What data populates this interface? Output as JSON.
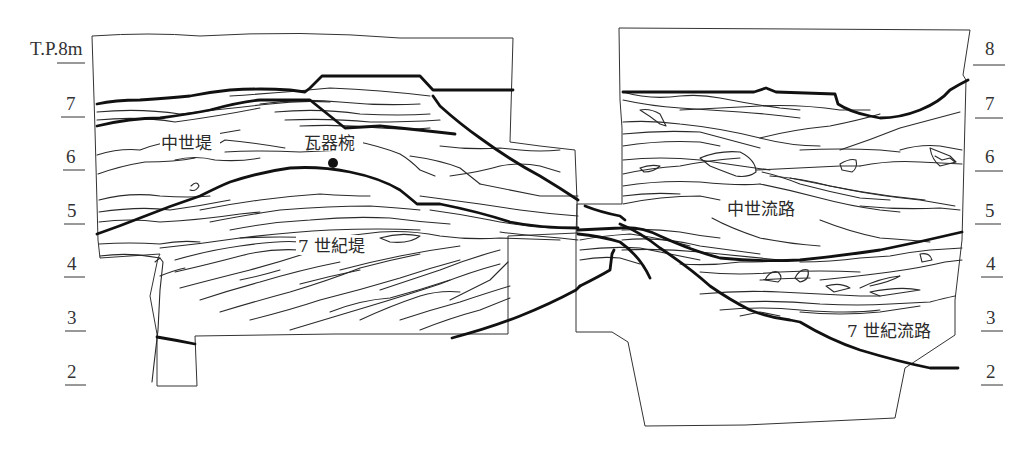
{
  "diagram": {
    "type": "stratigraphic cross-section",
    "ink_color": "#222222",
    "background": "#ffffff"
  },
  "left_scale": {
    "unit_label": "T.P.8m",
    "ticks": [
      {
        "label": "T.P.8m",
        "y": 62
      },
      {
        "label": "7",
        "y": 117
      },
      {
        "label": "6",
        "y": 170
      },
      {
        "label": "5",
        "y": 224
      },
      {
        "label": "4",
        "y": 277
      },
      {
        "label": "3",
        "y": 331
      },
      {
        "label": "2",
        "y": 385
      }
    ]
  },
  "right_scale": {
    "ticks": [
      {
        "label": "8",
        "y": 62
      },
      {
        "label": "7",
        "y": 117
      },
      {
        "label": "6",
        "y": 170
      },
      {
        "label": "5",
        "y": 224
      },
      {
        "label": "4",
        "y": 277
      },
      {
        "label": "3",
        "y": 331
      },
      {
        "label": "2",
        "y": 385
      }
    ]
  },
  "labels": {
    "medieval_embankment": "中世堤",
    "earthenware_bowl": "瓦器椀",
    "seventh_century_embankment": "7 世紀堤",
    "medieval_channel": "中世流路",
    "seventh_century_channel": "7 世紀流路"
  }
}
